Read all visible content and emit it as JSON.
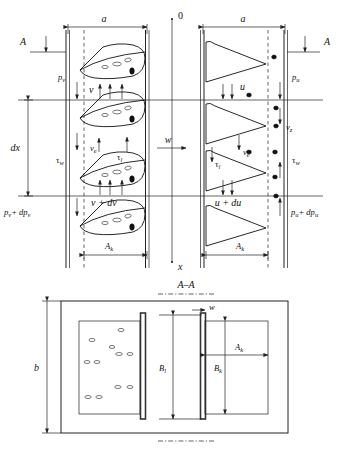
{
  "figure": {
    "section_label": "A–A"
  },
  "axis": {
    "origin_label": "0",
    "x_label": "x",
    "w_label": "w"
  },
  "upper": {
    "section_marker_left": "A",
    "section_marker_right": "A",
    "width_label_left": "a",
    "width_label_right": "a",
    "height_label": "dx",
    "left_channel": {
      "pressure_top": "p",
      "pressure_top_sub": "v",
      "pressure_bottom": "p",
      "pressure_bottom_sub": "v",
      "pressure_bottom_delta": "+ dp",
      "pressure_bottom_delta_sub": "v",
      "velocity_top": "v",
      "velocity_bottom": "v + dv",
      "velocity_e": "v",
      "velocity_e_sub": "e",
      "shear_wall": "τ",
      "shear_wall_sub": "w",
      "shear_interface": "τ",
      "shear_interface_sub": "l",
      "area_label": "A",
      "area_label_sub": "k"
    },
    "right_channel": {
      "pressure_top": "p",
      "pressure_top_sub": "u",
      "pressure_bottom": "p",
      "pressure_bottom_sub": "u",
      "pressure_bottom_delta": "+ dp",
      "pressure_bottom_delta_sub": "u",
      "velocity_top": "u",
      "velocity_bottom": "u + du",
      "velocity_e": "v",
      "velocity_e_sub": "e",
      "velocity_z": "v",
      "velocity_z_sub": "z",
      "shear_wall": "τ",
      "shear_wall_sub": "w",
      "shear_interface": "τ",
      "shear_interface_sub": "l",
      "area_label": "A",
      "area_label_sub": "k"
    }
  },
  "lower": {
    "height_label": "b",
    "wall_thickness_label": "w",
    "left_height_label": "B",
    "left_height_label_sub": "l",
    "right_height_label": "B",
    "right_height_label_sub": "k",
    "right_width_label": "A",
    "right_width_label_sub": "k"
  },
  "colors": {
    "ink": "#111111",
    "line": "#222222",
    "wall": "#333333",
    "background": "#ffffff"
  }
}
